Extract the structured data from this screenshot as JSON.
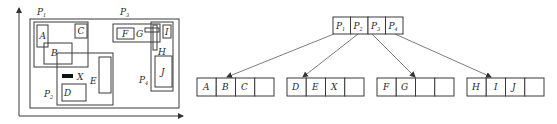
{
  "spatial": {
    "axes": {
      "x_arrow": true,
      "y_arrow": true
    },
    "regions": [
      {
        "id": "P1",
        "label": "P",
        "sub": "1"
      },
      {
        "id": "P2",
        "label": "P",
        "sub": "2"
      },
      {
        "id": "P3",
        "label": "P",
        "sub": "3"
      },
      {
        "id": "P4",
        "label": "P",
        "sub": "4"
      }
    ],
    "objects": [
      "A",
      "B",
      "C",
      "D",
      "E",
      "F",
      "G",
      "H",
      "I",
      "J",
      "X"
    ]
  },
  "tree": {
    "root": {
      "entries": [
        {
          "label": "P",
          "sub": "1"
        },
        {
          "label": "P",
          "sub": "2"
        },
        {
          "label": "P",
          "sub": "3"
        },
        {
          "label": "P",
          "sub": "4"
        }
      ]
    },
    "leaves": [
      {
        "entries": [
          "A",
          "B",
          "C",
          ""
        ]
      },
      {
        "entries": [
          "D",
          "E",
          "X",
          ""
        ]
      },
      {
        "entries": [
          "F",
          "G",
          "",
          ""
        ]
      },
      {
        "entries": [
          "H",
          "I",
          "J",
          ""
        ]
      }
    ]
  }
}
